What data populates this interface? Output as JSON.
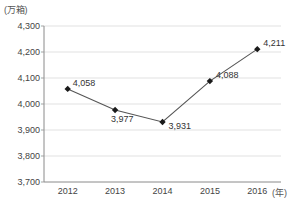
{
  "chart_data": {
    "type": "line",
    "title": "",
    "subtitle": "",
    "xlabel": "(年)",
    "ylabel": "(万箱)",
    "categories": [
      "2012",
      "2013",
      "2014",
      "2015",
      "2016"
    ],
    "x": [
      2012,
      2013,
      2014,
      2015,
      2016
    ],
    "values": [
      4058,
      3977,
      3931,
      4088,
      4211
    ],
    "point_labels": [
      "4,058",
      "3,977",
      "3,931",
      "4,088",
      "4,211"
    ],
    "series": [
      {
        "name": "",
        "values": [
          4058,
          3977,
          3931,
          4088,
          4211
        ]
      }
    ],
    "ylim": [
      3700,
      4300
    ],
    "yticks": [
      3700,
      3800,
      3900,
      4000,
      4100,
      4200,
      4300
    ],
    "ytick_labels": [
      "3,700",
      "3,800",
      "3,900",
      "4,000",
      "4,100",
      "4,200",
      "4,300"
    ],
    "xtick_labels": [
      "2012",
      "2013",
      "2014",
      "2015",
      "2016"
    ],
    "grid": true,
    "grid_axis": "y",
    "legend": false,
    "legend_position": "none",
    "marker": "diamond",
    "line_color": "#555555",
    "marker_color": "#1a1a1a",
    "grid_color": "#d9d9d9",
    "axis_color": "#999999",
    "label_positions": [
      "above-right",
      "below-right",
      "right",
      "right",
      "right"
    ]
  },
  "axes": {
    "y_unit": "(万箱)",
    "x_unit": "(年)"
  }
}
